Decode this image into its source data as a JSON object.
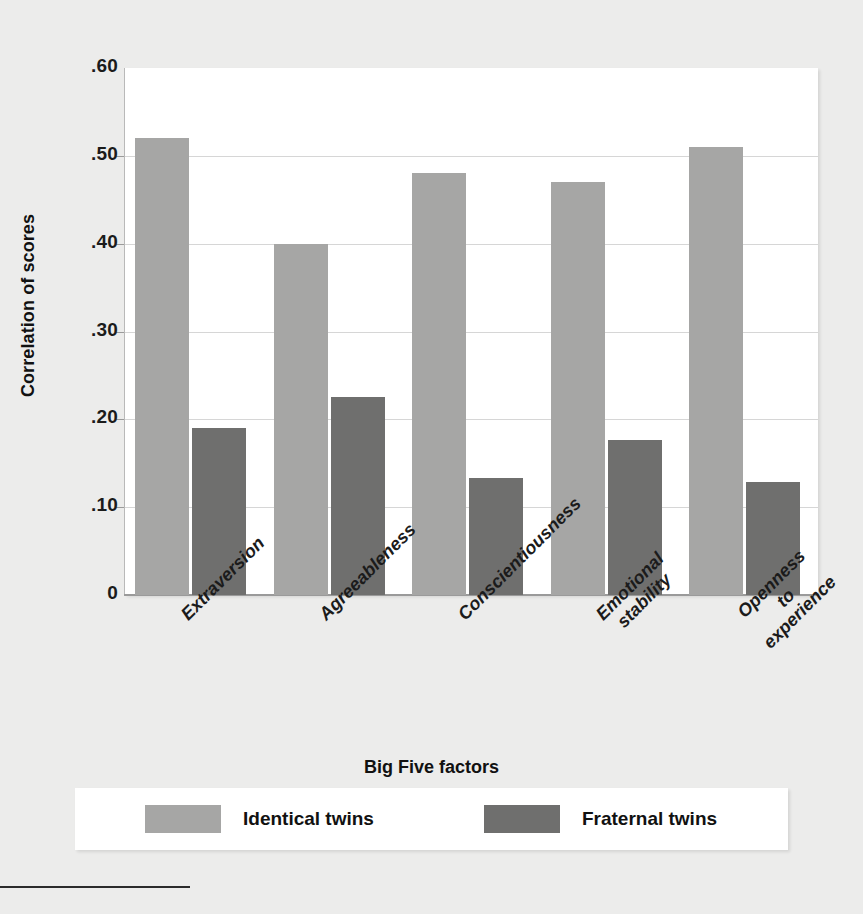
{
  "chart_data": {
    "type": "bar",
    "title": "",
    "xlabel": "Big Five factors",
    "ylabel": "Correlation of scores",
    "categories": [
      "Extraversion",
      "Agreeableness",
      "Conscientiousness",
      "Emotional stability",
      "Openness to experience"
    ],
    "category_lines": [
      [
        "Extraversion"
      ],
      [
        "Agreeableness"
      ],
      [
        "Conscientiousness"
      ],
      [
        "Emotional",
        "stability"
      ],
      [
        "Openness",
        "to",
        "experience"
      ]
    ],
    "series": [
      {
        "name": "Identical twins",
        "color": "#a6a6a5",
        "values": [
          0.52,
          0.4,
          0.48,
          0.47,
          0.51
        ]
      },
      {
        "name": "Fraternal twins",
        "color": "#6f6f6e",
        "values": [
          0.19,
          0.225,
          0.133,
          0.177,
          0.129
        ]
      }
    ],
    "ylim": [
      0,
      0.6
    ],
    "yticks": [
      0.6,
      0.5,
      0.4,
      0.3,
      0.2,
      0.1,
      0
    ],
    "ytick_labels": [
      ".60",
      ".50",
      ".40",
      ".30",
      ".20",
      ".10",
      "0"
    ],
    "grid": true,
    "legend_position": "bottom"
  },
  "axis": {
    "y_title": "Correlation of scores",
    "x_title": "Big Five factors"
  },
  "legend": {
    "items": [
      {
        "label": "Identical twins",
        "color": "#a6a6a5"
      },
      {
        "label": "Fraternal twins",
        "color": "#6f6f6e"
      }
    ]
  },
  "colors": {
    "background": "#ececeb",
    "plot_background": "#ffffff",
    "gridline": "#d6d6d6",
    "axis": "#9a9a9a",
    "identical_twins": "#a6a6a5",
    "fraternal_twins": "#6f6f6e",
    "text": "#1b1b1b"
  }
}
